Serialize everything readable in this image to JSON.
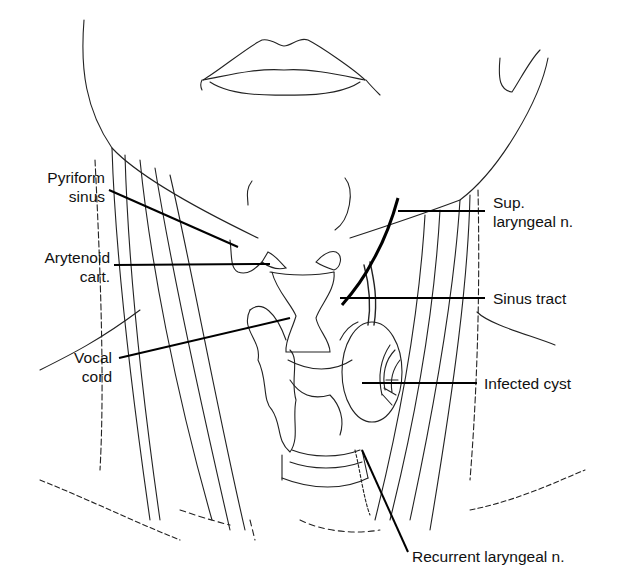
{
  "figure": {
    "labels_left": [
      {
        "id": "pyriform-sinus",
        "line1": "Pyriform",
        "line2": "sinus"
      },
      {
        "id": "arytenoid-cart",
        "line1": "Arytenoid",
        "line2": "cart."
      },
      {
        "id": "vocal-cord",
        "line1": "Vocal",
        "line2": "cord"
      }
    ],
    "labels_right": [
      {
        "id": "sup-laryngeal-n",
        "line1": "Sup.",
        "line2": "laryngeal n."
      },
      {
        "id": "sinus-tract",
        "line1": "Sinus tract"
      },
      {
        "id": "infected-cyst",
        "line1": "Infected cyst"
      },
      {
        "id": "recurrent-laryngeal-n",
        "line1": "Recurrent laryngeal n."
      }
    ],
    "colors": {
      "ink": "#111111",
      "background": "#ffffff"
    }
  }
}
